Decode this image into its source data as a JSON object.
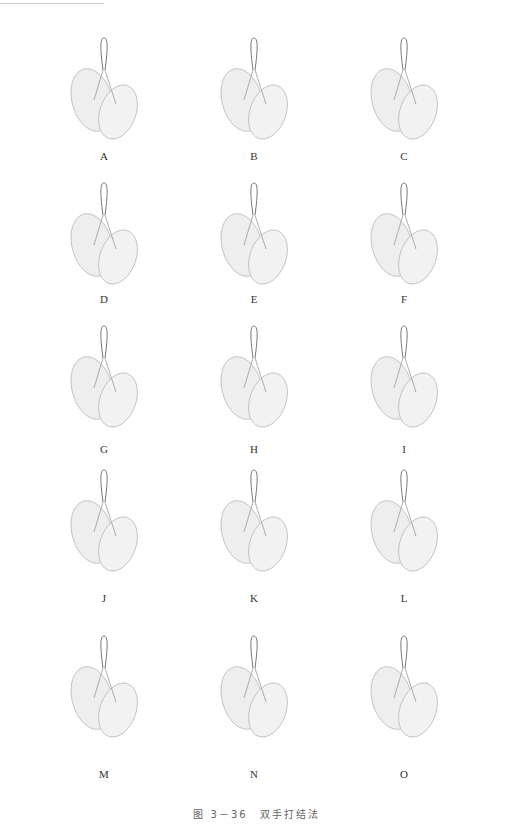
{
  "figure": {
    "caption": "图 3－36　双手打结法",
    "panels": [
      {
        "label": "A"
      },
      {
        "label": "B"
      },
      {
        "label": "C"
      },
      {
        "label": "D"
      },
      {
        "label": "E"
      },
      {
        "label": "F"
      },
      {
        "label": "G"
      },
      {
        "label": "H"
      },
      {
        "label": "I"
      },
      {
        "label": "J"
      },
      {
        "label": "K"
      },
      {
        "label": "L"
      },
      {
        "label": "M"
      },
      {
        "label": "N"
      },
      {
        "label": "O"
      }
    ],
    "illustration_icon": "hands-tying-knot-icon"
  }
}
